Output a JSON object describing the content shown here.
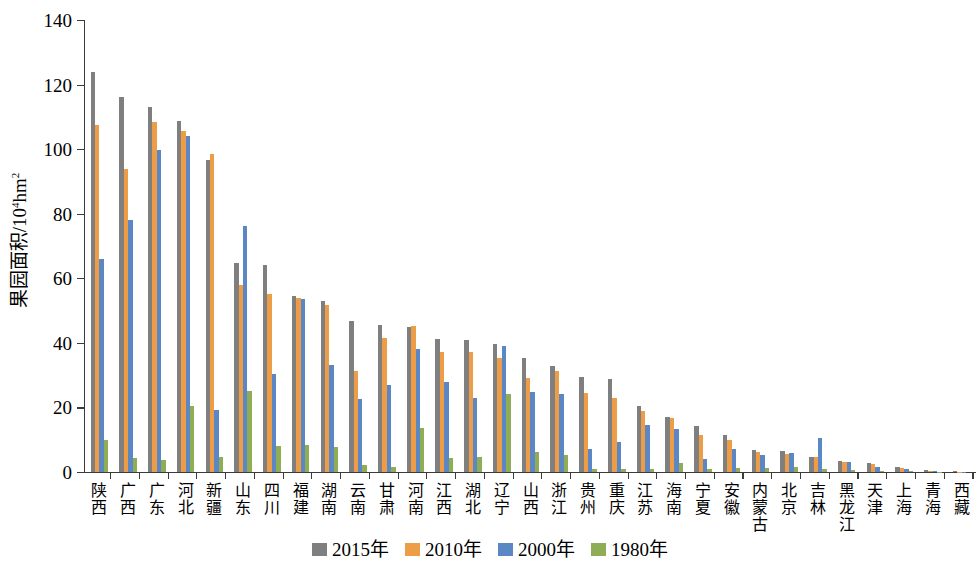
{
  "chart_data": {
    "type": "bar",
    "title": "",
    "xlabel": "",
    "ylabel": "果园面积/10⁴hm²",
    "ylim": [
      0,
      140
    ],
    "yticks": [
      0,
      20,
      40,
      60,
      80,
      100,
      120,
      140
    ],
    "grid": false,
    "legend_position": "bottom-center",
    "categories": [
      "陕西",
      "广西",
      "广东",
      "河北",
      "新疆",
      "山东",
      "四川",
      "福建",
      "湖南",
      "云南",
      "甘肃",
      "河南",
      "江西",
      "湖北",
      "辽宁",
      "山西",
      "浙江",
      "贵州",
      "重庆",
      "江苏",
      "海南",
      "宁夏",
      "安徽",
      "内蒙古",
      "北京",
      "吉林",
      "黑龙江",
      "天津",
      "上海",
      "青海",
      "西藏"
    ],
    "series": [
      {
        "name": "2015年",
        "color": "#7f7f7f",
        "values": [
          124.0,
          116.3,
          113.2,
          108.8,
          96.6,
          64.8,
          64.2,
          54.6,
          52.9,
          46.7,
          45.4,
          44.9,
          41.2,
          41.0,
          39.8,
          35.4,
          32.8,
          29.5,
          28.7,
          20.6,
          17.1,
          14.3,
          11.5,
          6.9,
          6.4,
          4.8,
          3.5,
          2.9,
          1.6,
          0.5,
          0.2
        ]
      },
      {
        "name": "2010年",
        "color": "#ed9c47",
        "values": [
          107.6,
          93.8,
          108.3,
          105.7,
          98.6,
          57.8,
          55.0,
          53.8,
          51.7,
          31.2,
          41.5,
          45.2,
          37.3,
          37.3,
          35.2,
          29.0,
          31.4,
          24.6,
          22.8,
          18.8,
          16.8,
          11.4,
          9.9,
          6.1,
          5.5,
          4.5,
          3.1,
          2.6,
          1.3,
          0.4,
          0.1
        ]
      },
      {
        "name": "2000年",
        "color": "#5b87c5",
        "values": [
          66.0,
          78.1,
          99.8,
          104.0,
          19.1,
          76.3,
          30.5,
          53.5,
          33.1,
          22.5,
          26.9,
          38.2,
          27.8,
          22.9,
          39.1,
          24.9,
          24.3,
          7.2,
          9.2,
          14.7,
          13.3,
          3.9,
          7.0,
          5.3,
          5.9,
          10.5,
          3.1,
          1.4,
          0.8,
          0.2,
          0.1
        ]
      },
      {
        "name": "1980年",
        "color": "#8fad55",
        "values": [
          10.0,
          4.2,
          3.6,
          20.5,
          4.5,
          25.1,
          8.2,
          8.3,
          7.6,
          2.2,
          1.6,
          13.7,
          4.4,
          4.5,
          24.1,
          6.1,
          5.4,
          1.0,
          0.8,
          1.0,
          2.9,
          0.8,
          1.3,
          1.2,
          1.5,
          0.9,
          0.6,
          0.4,
          0.3,
          0.1,
          0.0
        ]
      }
    ]
  },
  "legend": {
    "items": [
      {
        "label": "2015年",
        "color": "#7f7f7f"
      },
      {
        "label": "2010年",
        "color": "#ed9c47"
      },
      {
        "label": "2000年",
        "color": "#5b87c5"
      },
      {
        "label": "1980年",
        "color": "#8fad55"
      }
    ]
  },
  "axis": {
    "y_title_main": "果园面积/10",
    "y_title_sup": "4",
    "y_title_tail": "hm",
    "y_title_tail_sup": "2"
  }
}
